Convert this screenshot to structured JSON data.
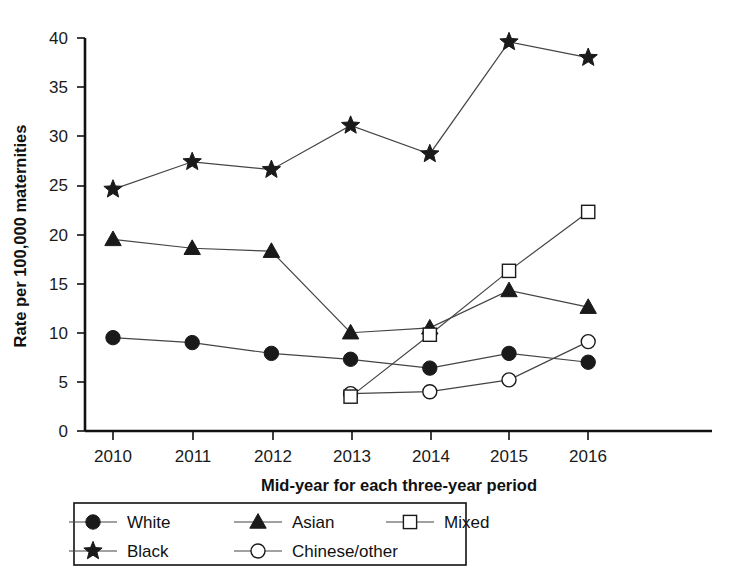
{
  "chart_data": {
    "type": "line",
    "title": "",
    "xlabel": "Mid-year for each three-year period",
    "ylabel": "Rate per 100,000 maternities",
    "categories": [
      "2010",
      "2011",
      "2012",
      "2013",
      "2014",
      "2015",
      "2016"
    ],
    "x": [
      2010,
      2011,
      2012,
      2013,
      2014,
      2015,
      2016
    ],
    "xlim": [
      2009.5,
      2016.6
    ],
    "ylim": [
      0,
      40
    ],
    "yticks": [
      0,
      5,
      10,
      15,
      20,
      25,
      30,
      35,
      40
    ],
    "grid": false,
    "legend_position": "bottom",
    "series": [
      {
        "name": "White",
        "marker": "filled-circle",
        "color": "#1a1a1a",
        "values": [
          9.5,
          9.0,
          7.9,
          7.3,
          6.4,
          7.9,
          7.0
        ]
      },
      {
        "name": "Black",
        "marker": "filled-star",
        "color": "#1a1a1a",
        "values": [
          24.6,
          27.4,
          26.6,
          31.1,
          28.2,
          39.6,
          38.0
        ]
      },
      {
        "name": "Asian",
        "marker": "filled-triangle",
        "color": "#1a1a1a",
        "values": [
          19.5,
          18.6,
          18.3,
          10.0,
          10.5,
          14.3,
          12.6
        ]
      },
      {
        "name": "Chinese/other",
        "marker": "open-circle",
        "color": "#1a1a1a",
        "values": [
          null,
          null,
          null,
          3.8,
          4.0,
          5.2,
          9.1
        ]
      },
      {
        "name": "Mixed",
        "marker": "open-square",
        "color": "#1a1a1a",
        "values": [
          null,
          null,
          null,
          3.5,
          9.8,
          16.3,
          22.3
        ]
      }
    ]
  },
  "axes": {
    "y_title": "Rate per 100,000 maternities",
    "x_title": "Mid-year for each three-year period",
    "y_tick_labels": [
      "0",
      "5",
      "10",
      "15",
      "20",
      "25",
      "30",
      "35",
      "40"
    ],
    "x_tick_labels": [
      "2010",
      "2011",
      "2012",
      "2013",
      "2014",
      "2015",
      "2016"
    ]
  },
  "legend": {
    "entries": [
      {
        "label": "White",
        "marker": "filled-circle"
      },
      {
        "label": "Asian",
        "marker": "filled-triangle"
      },
      {
        "label": "Mixed",
        "marker": "open-square"
      },
      {
        "label": "Black",
        "marker": "filled-star"
      },
      {
        "label": "Chinese/other",
        "marker": "open-circle"
      }
    ]
  },
  "colors": {
    "ink": "#1a1a1a",
    "line": "#444444",
    "background": "#ffffff"
  }
}
